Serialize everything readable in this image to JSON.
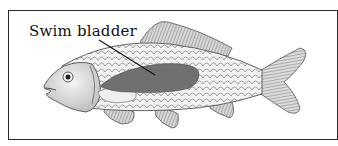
{
  "diagram": {
    "labels": [
      {
        "text": "Swim bladder",
        "target": "swim-bladder"
      }
    ],
    "colors": {
      "frame": "#2a2a2a",
      "swim_bladder": "#707070",
      "label_text": "#111111",
      "leader_line": "#111111"
    }
  }
}
